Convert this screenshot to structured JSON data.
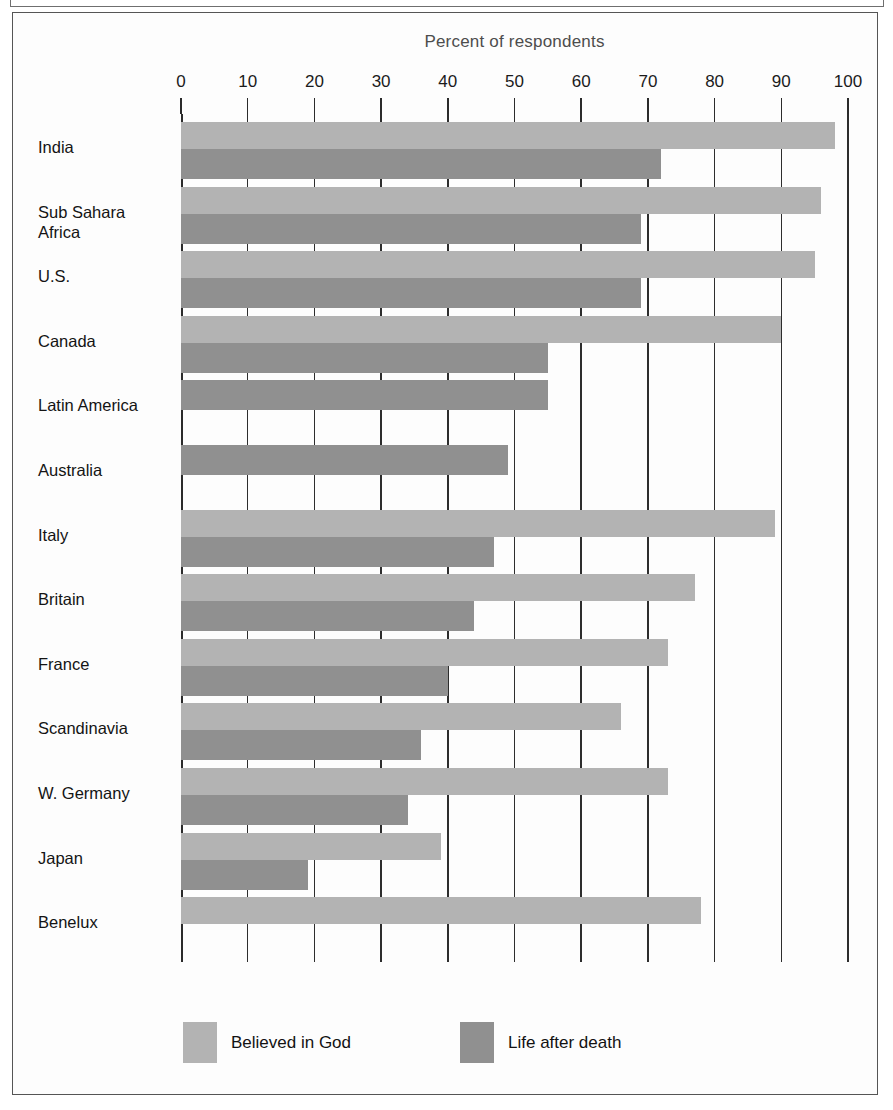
{
  "figure": {
    "title": "Percent of respondents"
  },
  "legend": [
    {
      "key": "god",
      "label": "Believed in God",
      "color": "#b3b3b3"
    },
    {
      "key": "death",
      "label": "Life after death",
      "color": "#909090"
    }
  ],
  "axis": {
    "ticks": [
      0,
      10,
      20,
      30,
      40,
      50,
      60,
      70,
      80,
      90,
      100
    ],
    "tick_labels": [
      "0",
      "10",
      "20",
      "30",
      "40",
      "50",
      "60",
      "70",
      "80",
      "90",
      "100"
    ]
  },
  "chart_data": {
    "type": "bar",
    "orientation": "horizontal",
    "title": "Percent of respondents",
    "xlabel": "Percent of respondents",
    "ylabel": "",
    "xlim": [
      0,
      100
    ],
    "grid": true,
    "legend_position": "bottom",
    "categories": [
      "India",
      "Sub Sahara Africa",
      "U.S.",
      "Canada",
      "Latin America",
      "Australia",
      "Italy",
      "Britain",
      "France",
      "Scandinavia",
      "W. Germany",
      "Japan",
      "Benelux"
    ],
    "category_display": [
      "India",
      "Sub Sahara\nAfrica",
      "U.S.",
      "Canada",
      "Latin America",
      "Australia",
      "Italy",
      "Britain",
      "France",
      "Scandinavia",
      "W. Germany",
      "Japan",
      "Benelux"
    ],
    "series": [
      {
        "name": "Believed in God",
        "color": "#b3b3b3",
        "values": [
          98,
          96,
          95,
          90,
          null,
          null,
          89,
          77,
          73,
          66,
          73,
          39,
          78
        ]
      },
      {
        "name": "Life after death",
        "color": "#909090",
        "values": [
          72,
          69,
          69,
          55,
          55,
          49,
          47,
          44,
          40,
          36,
          34,
          19,
          null
        ]
      }
    ]
  }
}
